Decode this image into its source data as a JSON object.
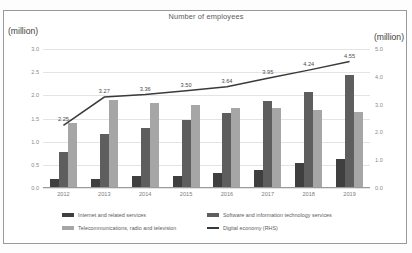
{
  "figure": {
    "title": "Number of employees",
    "unit_left": "(million)",
    "unit_right": "(million)"
  },
  "axes": {
    "left_ticks": [
      "3.0",
      "2.5",
      "2.0",
      "1.5",
      "1.0",
      "0.5",
      "0.0"
    ],
    "right_ticks": [
      "5.0",
      "4.0",
      "3.0",
      "2.0",
      "1.0",
      "0.0"
    ]
  },
  "legend": [
    {
      "label": "Internet and related services",
      "color": "#3f3f3f",
      "type": "bar"
    },
    {
      "label": "Software and information technology services",
      "color": "#5e5e5e",
      "type": "bar"
    },
    {
      "label": "Telecommunications, radio and television",
      "color": "#a6a6a6",
      "type": "bar"
    },
    {
      "label": "Digital economy (RHS)",
      "color": "#3a3a3a",
      "type": "line"
    }
  ],
  "chart_data": {
    "type": "bar",
    "title": "Number of employees",
    "xlabel": "",
    "ylabel": "(million)",
    "y2label": "(million)",
    "grid": true,
    "legend_position": "bottom",
    "categories": [
      "2012",
      "2013",
      "2014",
      "2015",
      "2016",
      "2017",
      "2018",
      "2019"
    ],
    "ylim": [
      0.0,
      3.0
    ],
    "y2lim": [
      0.0,
      5.0
    ],
    "series": [
      {
        "name": "Internet and related services",
        "type": "bar",
        "axis": "left",
        "color": "#3f3f3f",
        "values": [
          0.2,
          0.2,
          0.25,
          0.27,
          0.32,
          0.39,
          0.54,
          0.62
        ]
      },
      {
        "name": "Software and information technology services",
        "type": "bar",
        "axis": "left",
        "color": "#5e5e5e",
        "values": [
          0.78,
          1.17,
          1.29,
          1.46,
          1.61,
          1.88,
          2.07,
          2.43
        ]
      },
      {
        "name": "Telecommunications, radio and television",
        "type": "bar",
        "axis": "left",
        "color": "#a6a6a6",
        "values": [
          1.4,
          1.9,
          1.84,
          1.8,
          1.72,
          1.73,
          1.68,
          1.65
        ]
      },
      {
        "name": "Digital economy (RHS)",
        "type": "line",
        "axis": "right",
        "color": "#3a3a3a",
        "values": [
          2.25,
          3.27,
          3.36,
          3.5,
          3.64,
          3.95,
          4.24,
          4.55
        ],
        "labels": [
          "2.25",
          "3.27",
          "3.36",
          "3.50",
          "3.64",
          "3.95",
          "4.24",
          "4.55"
        ]
      }
    ]
  }
}
